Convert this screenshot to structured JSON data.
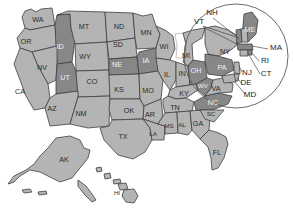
{
  "map": {
    "title": "United States map with state abbreviations",
    "projection_note": "contiguous US with Alaska and Hawaii insets",
    "colors": {
      "state_fill": "#b4b4b4",
      "state_fill_highlighted": "#878787",
      "state_border": "#3f3f3f",
      "background": "#ffffff",
      "label_text": "#2b2b2b",
      "label_text_light": "#f2f2f2",
      "callout_ring": "#5a5a5a",
      "leader_line": "#4a4a4a"
    },
    "legend_note": "Darker gray states are highlighted/selected",
    "zoom_callout": {
      "name": "northeast-magnifier",
      "shape": "circle",
      "region_label": "Northeast detail"
    },
    "states": [
      {
        "code": "WA",
        "name": "Washington",
        "highlighted": false,
        "label_x": 38,
        "label_y": 20
      },
      {
        "code": "OR",
        "name": "Oregon",
        "highlighted": false,
        "label_x": 26,
        "label_y": 42
      },
      {
        "code": "ID",
        "name": "Idaho",
        "highlighted": true,
        "label_x": 60,
        "label_y": 47
      },
      {
        "code": "MT",
        "name": "Montana",
        "highlighted": false,
        "label_x": 84,
        "label_y": 27
      },
      {
        "code": "ND",
        "name": "North Dakota",
        "highlighted": false,
        "label_x": 119,
        "label_y": 27
      },
      {
        "code": "MN",
        "name": "Minnesota",
        "highlighted": false,
        "label_x": 146,
        "label_y": 33
      },
      {
        "code": "WY",
        "name": "Wyoming",
        "highlighted": false,
        "label_x": 85,
        "label_y": 57
      },
      {
        "code": "SD",
        "name": "South Dakota",
        "highlighted": false,
        "label_x": 118,
        "label_y": 45
      },
      {
        "code": "NE",
        "name": "Nebraska",
        "highlighted": true,
        "label_x": 117,
        "label_y": 65
      },
      {
        "code": "IA",
        "name": "Iowa",
        "highlighted": true,
        "label_x": 146,
        "label_y": 61
      },
      {
        "code": "WI",
        "name": "Wisconsin",
        "highlighted": false,
        "label_x": 164,
        "label_y": 47
      },
      {
        "code": "MI",
        "name": "Michigan",
        "highlighted": false,
        "label_x": 186,
        "label_y": 56
      },
      {
        "code": "NV",
        "name": "Nevada",
        "highlighted": false,
        "label_x": 42,
        "label_y": 68
      },
      {
        "code": "UT",
        "name": "Utah",
        "highlighted": true,
        "label_x": 65,
        "label_y": 78
      },
      {
        "code": "CO",
        "name": "Colorado",
        "highlighted": false,
        "label_x": 92,
        "label_y": 82
      },
      {
        "code": "KS",
        "name": "Kansas",
        "highlighted": false,
        "label_x": 119,
        "label_y": 90
      },
      {
        "code": "MO",
        "name": "Missouri",
        "highlighted": false,
        "label_x": 148,
        "label_y": 91
      },
      {
        "code": "IL",
        "name": "Illinois",
        "highlighted": false,
        "label_x": 167,
        "label_y": 75
      },
      {
        "code": "IN",
        "name": "Indiana",
        "highlighted": false,
        "label_x": 182,
        "label_y": 74
      },
      {
        "code": "OH",
        "name": "Ohio",
        "highlighted": true,
        "label_x": 196,
        "label_y": 71
      },
      {
        "code": "CA",
        "name": "California",
        "highlighted": false,
        "label_x": 20,
        "label_y": 92
      },
      {
        "code": "AZ",
        "name": "Arizona",
        "highlighted": false,
        "label_x": 52,
        "label_y": 109
      },
      {
        "code": "NM",
        "name": "New Mexico",
        "highlighted": false,
        "label_x": 81,
        "label_y": 114
      },
      {
        "code": "OK",
        "name": "Oklahoma",
        "highlighted": false,
        "label_x": 129,
        "label_y": 111
      },
      {
        "code": "AR",
        "name": "Arkansas",
        "highlighted": false,
        "label_x": 150,
        "label_y": 115
      },
      {
        "code": "TX",
        "name": "Texas",
        "highlighted": false,
        "label_x": 123,
        "label_y": 137
      },
      {
        "code": "LA",
        "name": "Louisiana",
        "highlighted": false,
        "label_x": 153,
        "label_y": 134
      },
      {
        "code": "MS",
        "name": "Mississippi",
        "highlighted": false,
        "label_x": 169,
        "label_y": 126
      },
      {
        "code": "AL",
        "name": "Alabama",
        "highlighted": false,
        "label_x": 182,
        "label_y": 125
      },
      {
        "code": "GA",
        "name": "Georgia",
        "highlighted": false,
        "label_x": 198,
        "label_y": 124
      },
      {
        "code": "TN",
        "name": "Tennessee",
        "highlighted": false,
        "label_x": 175,
        "label_y": 108
      },
      {
        "code": "KY",
        "name": "Kentucky",
        "highlighted": false,
        "label_x": 184,
        "label_y": 94
      },
      {
        "code": "WV",
        "name": "West Virginia",
        "highlighted": true,
        "label_x": 203,
        "label_y": 86
      },
      {
        "code": "VA",
        "name": "Virginia",
        "highlighted": false,
        "label_x": 216,
        "label_y": 89
      },
      {
        "code": "NC",
        "name": "North Carolina",
        "highlighted": true,
        "label_x": 213,
        "label_y": 103
      },
      {
        "code": "SC",
        "name": "South Carolina",
        "highlighted": false,
        "label_x": 211,
        "label_y": 114
      },
      {
        "code": "FL",
        "name": "Florida",
        "highlighted": false,
        "label_x": 217,
        "label_y": 153
      },
      {
        "code": "NY",
        "name": "New York",
        "highlighted": false,
        "label_x": 225,
        "label_y": 52
      },
      {
        "code": "PA",
        "name": "Pennsylvania",
        "highlighted": true,
        "label_x": 222,
        "label_y": 68
      },
      {
        "code": "ME",
        "name": "Maine",
        "highlighted": true,
        "label_x": 250,
        "label_y": 30
      },
      {
        "code": "AK",
        "name": "Alaska",
        "highlighted": false,
        "label_x": 64,
        "label_y": 160
      },
      {
        "code": "HI",
        "name": "Hawaii",
        "highlighted": false,
        "label_x": 117,
        "label_y": 193
      }
    ],
    "callout_labels": [
      {
        "code": "NH",
        "name": "New Hampshire",
        "label_x": 212,
        "label_y": 13
      },
      {
        "code": "VT",
        "name": "Vermont",
        "label_x": 199,
        "label_y": 22
      },
      {
        "code": "MA",
        "name": "Massachusetts",
        "label_x": 276,
        "label_y": 48
      },
      {
        "code": "RI",
        "name": "Rhode Island",
        "label_x": 265,
        "label_y": 61
      },
      {
        "code": "CT",
        "name": "Connecticut",
        "label_x": 266,
        "label_y": 74
      },
      {
        "code": "NJ",
        "name": "New Jersey",
        "label_x": 247,
        "label_y": 73
      },
      {
        "code": "DE",
        "name": "Delaware",
        "label_x": 246,
        "label_y": 83
      },
      {
        "code": "MD",
        "name": "Maryland",
        "label_x": 250,
        "label_y": 95
      }
    ]
  }
}
